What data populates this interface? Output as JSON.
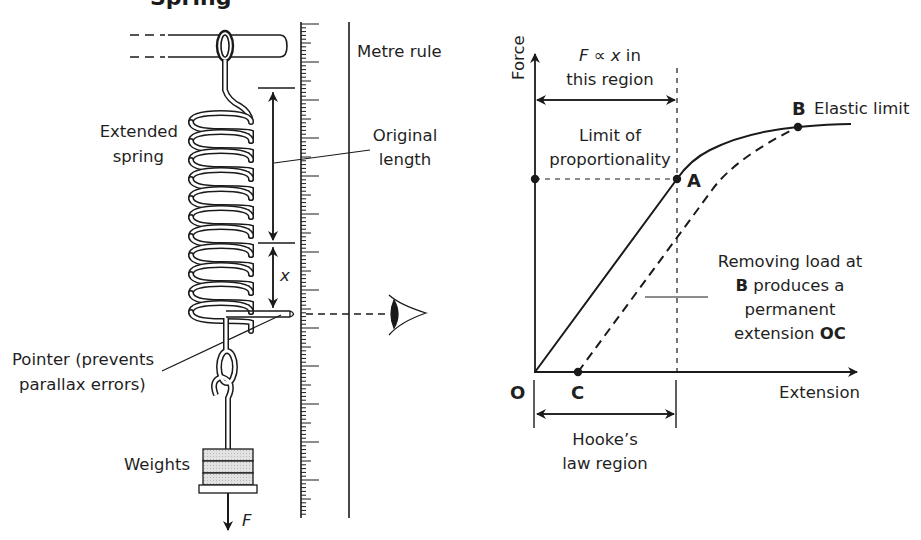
{
  "figure": {
    "title_fragment": "Spring"
  },
  "apparatus": {
    "labels": {
      "metre_rule": "Metre rule",
      "extended_spring_line1": "Extended",
      "extended_spring_line2": "spring",
      "original_length_line1": "Original",
      "original_length_line2": "length",
      "extension_symbol": "x",
      "pointer_line1": "Pointer (prevents",
      "pointer_line2": "parallax errors)",
      "weights": "Weights",
      "force_symbol": "F"
    },
    "icons": [
      "clamp-rod",
      "spring-coil",
      "metre-rule-scale",
      "pointer",
      "eye-icon",
      "hook",
      "weights-stack",
      "force-arrow"
    ],
    "ruler": {
      "minor_tick_spacing_px": 3.8,
      "major_every": 10
    }
  },
  "graph": {
    "y_axis_label": "Force",
    "x_axis_label": "Extension",
    "origin_label": "O",
    "point_a_label": "A",
    "point_b_label": "B",
    "point_c_label": "C",
    "elastic_limit": "Elastic limit",
    "proportional_line1": "F ∝ x in",
    "proportional_line2": "this region",
    "limit_prop_line1": "Limit of",
    "limit_prop_line2": "proportionality",
    "removing_line1": "Removing load at",
    "removing_line2_bold": "B",
    "removing_line2_rest": " produces a",
    "removing_line3": "permanent",
    "removing_line4_rest": "extension ",
    "removing_line4_bold": "OC",
    "hookes_line1": "Hooke’s",
    "hookes_line2": "law region"
  },
  "chart_data": {
    "type": "line",
    "title": "",
    "xlabel": "Extension",
    "ylabel": "Force",
    "grid": false,
    "legend": "none",
    "series": [
      {
        "name": "Loading (solid)",
        "style": "solid",
        "points": [
          [
            0,
            0
          ],
          [
            0.44,
            0.6
          ],
          [
            0.52,
            0.71
          ],
          [
            0.62,
            0.77
          ],
          [
            0.82,
            0.81
          ],
          [
            1.0,
            0.82
          ]
        ]
      },
      {
        "name": "Unloading from B (dashed)",
        "style": "dashed",
        "points": [
          [
            0.13,
            0
          ],
          [
            0.57,
            0.6
          ],
          [
            0.82,
            0.81
          ]
        ]
      }
    ],
    "annotations": [
      {
        "label": "O",
        "x": 0,
        "y": 0,
        "note": "origin"
      },
      {
        "label": "A",
        "x": 0.44,
        "y": 0.6,
        "note": "Limit of proportionality"
      },
      {
        "label": "B",
        "x": 0.82,
        "y": 0.81,
        "note": "Elastic limit"
      },
      {
        "label": "C",
        "x": 0.13,
        "y": 0,
        "note": "Permanent extension OC"
      },
      {
        "label": "F ∝ x in this region",
        "x_range": [
          0,
          0.44
        ]
      },
      {
        "label": "Hooke's law region",
        "x_range": [
          0,
          0.44
        ]
      }
    ],
    "xlim": [
      0,
      1.0
    ],
    "ylim": [
      0,
      1.0
    ]
  }
}
